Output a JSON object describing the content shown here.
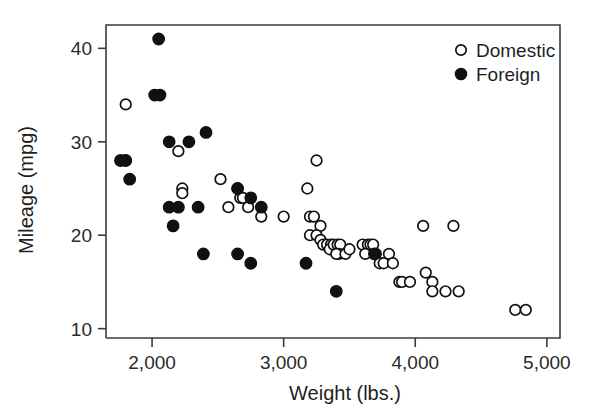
{
  "chart_data": {
    "type": "scatter",
    "title": "",
    "xlabel": "Weight (lbs.)",
    "ylabel": "Mileage (mpg)",
    "xlim": [
      1650,
      5100
    ],
    "ylim": [
      9,
      42.5
    ],
    "xticks": [
      2000,
      3000,
      4000,
      5000
    ],
    "xtick_labels": [
      "2,000",
      "3,000",
      "4,000",
      "5,000"
    ],
    "yticks": [
      10,
      20,
      30,
      40
    ],
    "ytick_labels": [
      "10",
      "20",
      "30",
      "40"
    ],
    "grid": false,
    "legend_position": "top-right",
    "series": [
      {
        "name": "Domestic",
        "marker": "open-circle",
        "color": "#111111",
        "points": [
          [
            1800,
            34
          ],
          [
            1800,
            28
          ],
          [
            2230,
            25
          ],
          [
            2230,
            24.5
          ],
          [
            2200,
            29
          ],
          [
            2520,
            26
          ],
          [
            2650,
            25
          ],
          [
            2670,
            24
          ],
          [
            2690,
            24
          ],
          [
            2580,
            23
          ],
          [
            2730,
            23
          ],
          [
            2830,
            22
          ],
          [
            3000,
            22
          ],
          [
            3180,
            25
          ],
          [
            3250,
            28
          ],
          [
            3200,
            22
          ],
          [
            3230,
            22
          ],
          [
            3280,
            21
          ],
          [
            3200,
            20
          ],
          [
            3250,
            20
          ],
          [
            3280,
            19.5
          ],
          [
            3300,
            19
          ],
          [
            3330,
            19
          ],
          [
            3360,
            19
          ],
          [
            3350,
            18.5
          ],
          [
            3380,
            19
          ],
          [
            3410,
            19
          ],
          [
            3430,
            19
          ],
          [
            3420,
            18
          ],
          [
            3400,
            18
          ],
          [
            3470,
            18
          ],
          [
            3500,
            18.5
          ],
          [
            3600,
            19
          ],
          [
            3640,
            19
          ],
          [
            3660,
            19
          ],
          [
            3680,
            19
          ],
          [
            3620,
            18
          ],
          [
            3700,
            18
          ],
          [
            3730,
            17
          ],
          [
            3760,
            17
          ],
          [
            3800,
            18
          ],
          [
            3830,
            17
          ],
          [
            3880,
            15
          ],
          [
            3900,
            15
          ],
          [
            3960,
            15
          ],
          [
            4060,
            21
          ],
          [
            4130,
            15
          ],
          [
            4130,
            14
          ],
          [
            4080,
            16
          ],
          [
            4230,
            14
          ],
          [
            4290,
            21
          ],
          [
            4330,
            14
          ],
          [
            4760,
            12
          ],
          [
            4840,
            12
          ]
        ]
      },
      {
        "name": "Foreign",
        "marker": "filled-circle",
        "color": "#111111",
        "points": [
          [
            2050,
            41
          ],
          [
            2020,
            35
          ],
          [
            2060,
            35
          ],
          [
            1760,
            28
          ],
          [
            1800,
            28
          ],
          [
            2130,
            30
          ],
          [
            2410,
            31
          ],
          [
            1830,
            26
          ],
          [
            2130,
            23
          ],
          [
            2200,
            23
          ],
          [
            2280,
            30
          ],
          [
            2350,
            23
          ],
          [
            2160,
            21
          ],
          [
            2650,
            25
          ],
          [
            2750,
            24
          ],
          [
            2830,
            23
          ],
          [
            2390,
            18
          ],
          [
            2650,
            18
          ],
          [
            2750,
            17
          ],
          [
            3170,
            17
          ],
          [
            3400,
            14
          ],
          [
            3690,
            18
          ]
        ]
      }
    ]
  },
  "legend": {
    "entries": [
      {
        "label": "Domestic",
        "marker": "open-circle"
      },
      {
        "label": "Foreign",
        "marker": "filled-circle"
      }
    ]
  }
}
